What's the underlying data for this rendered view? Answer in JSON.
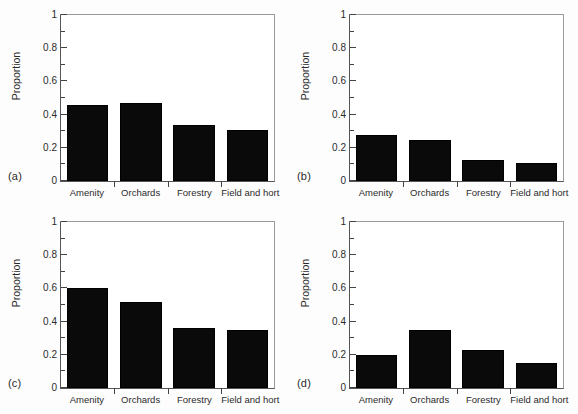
{
  "figure": {
    "background": "#fdfdfd",
    "bar_color": "#0a0a0a",
    "axis_color": "#555555"
  },
  "chart_data": [
    {
      "type": "bar",
      "panel": "(a)",
      "title": "",
      "xlabel": "",
      "ylabel": "Proportion",
      "categories": [
        "Amenity",
        "Orchards",
        "Forestry",
        "Field and hort"
      ],
      "values": [
        0.46,
        0.47,
        0.34,
        0.31
      ],
      "ylim": [
        0,
        1
      ],
      "yticks": [
        0,
        0.2,
        0.4,
        0.6,
        0.8,
        1
      ],
      "ytick_labels": [
        "0",
        "0.2",
        "0.4",
        "0.6",
        "0.8",
        "1"
      ],
      "yminor_ticks": [
        0.1,
        0.3,
        0.5,
        0.7,
        0.9
      ],
      "grid": false,
      "legend": "none"
    },
    {
      "type": "bar",
      "panel": "(b)",
      "title": "",
      "xlabel": "",
      "ylabel": "Proportion",
      "categories": [
        "Amenity",
        "Orchards",
        "Forestry",
        "Field and hort"
      ],
      "values": [
        0.275,
        0.245,
        0.125,
        0.11
      ],
      "ylim": [
        0,
        1
      ],
      "yticks": [
        0,
        0.2,
        0.4,
        0.6,
        0.8,
        1
      ],
      "ytick_labels": [
        "0",
        "0.2",
        "0.4",
        "0.6",
        "0.8",
        "1"
      ],
      "yminor_ticks": [
        0.1,
        0.3,
        0.5,
        0.7,
        0.9
      ],
      "grid": false,
      "legend": "none"
    },
    {
      "type": "bar",
      "panel": "(c)",
      "title": "",
      "xlabel": "",
      "ylabel": "Proportion",
      "categories": [
        "Amenity",
        "Orchards",
        "Forestry",
        "Field and hort"
      ],
      "values": [
        0.6,
        0.52,
        0.36,
        0.35
      ],
      "ylim": [
        0,
        1
      ],
      "yticks": [
        0,
        0.2,
        0.4,
        0.6,
        0.8,
        1
      ],
      "ytick_labels": [
        "0",
        "0.2",
        "0.4",
        "0.6",
        "0.8",
        "1"
      ],
      "yminor_ticks": [
        0.1,
        0.3,
        0.5,
        0.7,
        0.9
      ],
      "grid": false,
      "legend": "none"
    },
    {
      "type": "bar",
      "panel": "(d)",
      "title": "",
      "xlabel": "",
      "ylabel": "Proportion",
      "categories": [
        "Amenity",
        "Orchards",
        "Forestry",
        "Field and hort"
      ],
      "values": [
        0.2,
        0.35,
        0.23,
        0.15
      ],
      "ylim": [
        0,
        1
      ],
      "yticks": [
        0,
        0.2,
        0.4,
        0.6,
        0.8,
        1
      ],
      "ytick_labels": [
        "0",
        "0.2",
        "0.4",
        "0.6",
        "0.8",
        "1"
      ],
      "yminor_ticks": [
        0.1,
        0.3,
        0.5,
        0.7,
        0.9
      ],
      "grid": false,
      "legend": "none"
    }
  ]
}
